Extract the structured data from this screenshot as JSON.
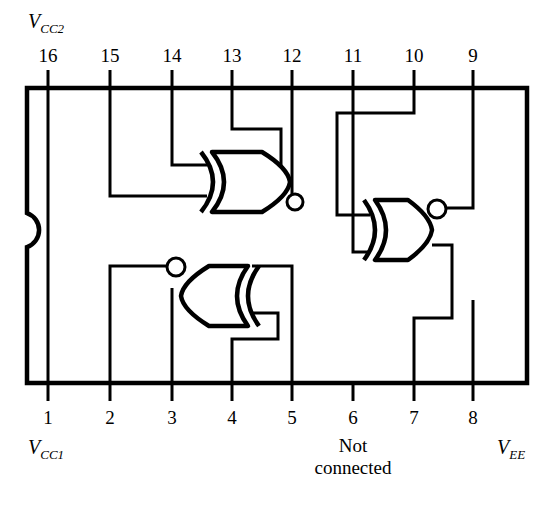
{
  "diagram": {
    "package": {
      "type": "dual-in-line-package",
      "pin_count": 16,
      "notch": "left-edge-semicircle",
      "outline_color": "#000000",
      "background_color": "#ffffff"
    },
    "labels": {
      "vcc2": {
        "symbol": "V",
        "subscript": "CC2",
        "text": "VCC2"
      },
      "vcc1": {
        "symbol": "V",
        "subscript": "CC1",
        "text": "VCC1"
      },
      "vee": {
        "symbol": "V",
        "subscript": "EE",
        "text": "VEE"
      },
      "not_connected_line1": "Not",
      "not_connected_line2": "connected"
    },
    "pins": {
      "top": [
        {
          "number": "16",
          "x": 48
        },
        {
          "number": "15",
          "x": 110
        },
        {
          "number": "14",
          "x": 172
        },
        {
          "number": "13",
          "x": 232
        },
        {
          "number": "12",
          "x": 292
        },
        {
          "number": "11",
          "x": 353
        },
        {
          "number": "10",
          "x": 414
        },
        {
          "number": "9",
          "x": 473
        }
      ],
      "bottom": [
        {
          "number": "1",
          "x": 48
        },
        {
          "number": "2",
          "x": 110
        },
        {
          "number": "3",
          "x": 172
        },
        {
          "number": "4",
          "x": 232
        },
        {
          "number": "5",
          "x": 292
        },
        {
          "number": "6",
          "x": 353
        },
        {
          "number": "7",
          "x": 414
        },
        {
          "number": "8",
          "x": 473
        }
      ]
    },
    "gates": [
      {
        "id": "gate-1",
        "type": "xnor",
        "orientation": "right",
        "inputs": [
          "15",
          "14",
          "13"
        ],
        "output_pin": "12"
      },
      {
        "id": "gate-2",
        "type": "xnor",
        "orientation": "right",
        "inputs": [
          "11",
          "10"
        ],
        "output_pin": "9"
      },
      {
        "id": "gate-3",
        "type": "xnor",
        "orientation": "left",
        "inputs": [
          "4",
          "5"
        ],
        "output_pin": "2"
      }
    ],
    "power_pins": {
      "vcc2_pin": "16",
      "vcc1_pin": "1",
      "vee_pin": "8",
      "not_connected_pin": "6"
    }
  }
}
